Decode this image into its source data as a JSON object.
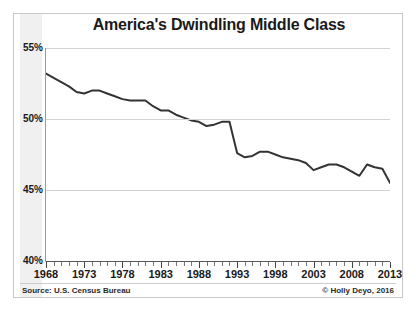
{
  "chart_data": {
    "type": "line",
    "title": "America's Dwindling Middle Class",
    "xlabel": "",
    "ylabel": "",
    "xlim": [
      1968,
      2013
    ],
    "ylim": [
      40,
      55
    ],
    "grid": true,
    "legend": false,
    "y_tick_labels": [
      "55%",
      "50%",
      "45%",
      "40%"
    ],
    "y_ticks": [
      55,
      50,
      45,
      40
    ],
    "x_tick_labels": [
      "1968",
      "1973",
      "1978",
      "1983",
      "1988",
      "1993",
      "1998",
      "2003",
      "2008",
      "2013"
    ],
    "x_ticks": [
      1968,
      1973,
      1978,
      1983,
      1988,
      1993,
      1998,
      2003,
      2008,
      2013
    ],
    "x_minor_tick_interval": 1,
    "series": [
      {
        "name": "Share of adults in middle-income households",
        "color": "#333333",
        "x": [
          1968,
          1969,
          1970,
          1971,
          1972,
          1973,
          1974,
          1975,
          1976,
          1977,
          1978,
          1979,
          1980,
          1981,
          1982,
          1983,
          1984,
          1985,
          1986,
          1987,
          1988,
          1989,
          1990,
          1991,
          1992,
          1993,
          1994,
          1995,
          1996,
          1997,
          1998,
          1999,
          2000,
          2001,
          2002,
          2003,
          2004,
          2005,
          2006,
          2007,
          2008,
          2009,
          2010,
          2011,
          2012,
          2013
        ],
        "values": [
          53.2,
          52.9,
          52.6,
          52.3,
          51.9,
          51.8,
          52.0,
          52.0,
          51.8,
          51.6,
          51.4,
          51.3,
          51.3,
          51.3,
          50.9,
          50.6,
          50.6,
          50.3,
          50.1,
          49.9,
          49.8,
          49.5,
          49.6,
          49.8,
          49.8,
          47.6,
          47.3,
          47.4,
          47.7,
          47.7,
          47.5,
          47.3,
          47.2,
          47.1,
          46.9,
          46.4,
          46.6,
          46.8,
          46.8,
          46.6,
          46.3,
          46.0,
          46.8,
          46.6,
          46.5,
          45.5
        ],
        "marker": "none",
        "line_width": 2
      }
    ],
    "annotations": {
      "source": "Source: U.S. Census Bureau",
      "credit": "© Holly Deyo, 2016"
    }
  },
  "figure": {
    "title": "America's Dwindling Middle Class",
    "source": "Source: U.S. Census Bureau",
    "credit": "© Holly Deyo, 2016",
    "caption_ghost": ""
  },
  "axes": {
    "y_labels": [
      "55%",
      "50%",
      "45%",
      "40%"
    ],
    "x_labels": [
      "1968",
      "1973",
      "1978",
      "1983",
      "1988",
      "1993",
      "1998",
      "2003",
      "2008",
      "2013"
    ]
  },
  "colors": {
    "line": "#333333",
    "grid": "#d2d2d2",
    "axis": "#5a5a5a",
    "band": "#f0f0f0",
    "text": "#1a1a1a",
    "card_border": "#c9c9c9"
  }
}
